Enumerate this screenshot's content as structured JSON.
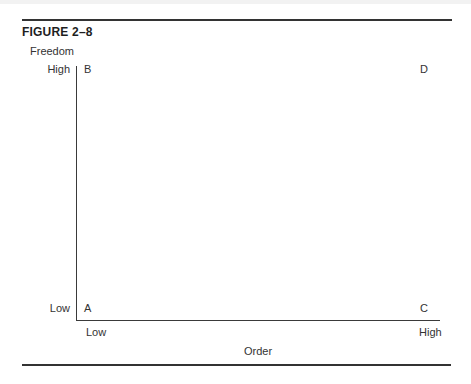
{
  "figure": {
    "label": "FIGURE 2–8"
  },
  "axes": {
    "y": {
      "title": "Freedom",
      "high_label": "High",
      "low_label": "Low"
    },
    "x": {
      "title": "Order",
      "low_label": "Low",
      "high_label": "High"
    }
  },
  "corners": {
    "top_left": "B",
    "top_right": "D",
    "bottom_left": "A",
    "bottom_right": "C"
  },
  "colors": {
    "rule": "#333333",
    "axis": "#3a3a3a",
    "text": "#333333",
    "background": "#ffffff"
  }
}
